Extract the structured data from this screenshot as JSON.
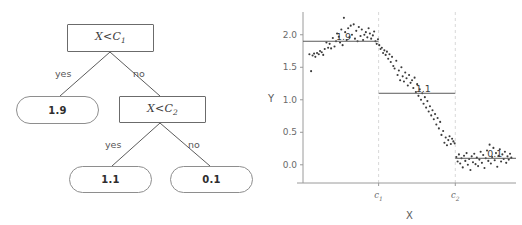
{
  "figure": {
    "left_panel_name": "decision-tree",
    "right_panel_name": "step-function-scatter-plot"
  },
  "tree": {
    "root": {
      "label_html": "X&lt;C",
      "var": "X",
      "op": "<",
      "threshold": "C",
      "sub": "1",
      "full_text": "X < C1"
    },
    "internal": {
      "label_html": "X&lt;C",
      "var": "X",
      "op": "<",
      "threshold": "C",
      "sub": "2",
      "full_text": "X < C2"
    },
    "leaves": [
      {
        "name": "leaf-1-9",
        "value": "1.9"
      },
      {
        "name": "leaf-1-1",
        "value": "1.1"
      },
      {
        "name": "leaf-0-1",
        "value": "0.1"
      }
    ],
    "edges": [
      {
        "name": "edge-root-yes",
        "label": "yes"
      },
      {
        "name": "edge-root-no",
        "label": "no"
      },
      {
        "name": "edge-inner-yes",
        "label": "yes"
      },
      {
        "name": "edge-inner-no",
        "label": "no"
      }
    ]
  },
  "chart_data": {
    "type": "scatter",
    "title": "",
    "xlabel": "X",
    "ylabel": "Y",
    "xlim": [
      0,
      10
    ],
    "ylim": [
      -0.28,
      2.35
    ],
    "grid": false,
    "legend": null,
    "yticks": [
      0.0,
      0.5,
      1.0,
      1.5,
      2.0
    ],
    "ytick_labels": [
      "0.0",
      "0.5",
      "1.0",
      "1.5",
      "2.0"
    ],
    "xticks": [
      3.55,
      7.15
    ],
    "xtick_labels": [
      "c1",
      "c2"
    ],
    "xtick_sub_labels": [
      {
        "base": "c",
        "sub": "1"
      },
      {
        "base": "c",
        "sub": "2"
      }
    ],
    "vlines": [
      {
        "name": "threshold-c1",
        "x": 3.55,
        "style": "dashed",
        "color": "#d8d8d8"
      },
      {
        "name": "threshold-c2",
        "x": 7.15,
        "style": "dashed",
        "color": "#d8d8d8"
      }
    ],
    "step_segments": [
      {
        "name": "segment-1-9",
        "x_start": 0.0,
        "x_end": 3.55,
        "y": 1.9,
        "annotation": "1.9",
        "annot_x": 1.9,
        "annot_y": 1.9
      },
      {
        "name": "segment-1-1",
        "x_start": 3.55,
        "x_end": 7.15,
        "y": 1.1,
        "annotation": "1.1",
        "annot_x": 5.65,
        "annot_y": 1.1
      },
      {
        "name": "segment-0-1",
        "x_start": 7.15,
        "x_end": 10.0,
        "y": 0.1,
        "annotation": "0.1",
        "annot_x": 9.0,
        "annot_y": 0.1
      }
    ],
    "series": [
      {
        "name": "observations",
        "marker": "dot",
        "color": "#3b3b3b",
        "points": [
          [
            0.3,
            1.7
          ],
          [
            0.38,
            1.44
          ],
          [
            0.45,
            1.68
          ],
          [
            0.52,
            1.71
          ],
          [
            0.58,
            1.66
          ],
          [
            0.66,
            1.72
          ],
          [
            0.74,
            1.7
          ],
          [
            0.8,
            1.75
          ],
          [
            0.88,
            1.73
          ],
          [
            0.95,
            1.69
          ],
          [
            1.02,
            1.78
          ],
          [
            1.1,
            1.88
          ],
          [
            1.18,
            1.8
          ],
          [
            1.25,
            1.86
          ],
          [
            1.32,
            1.79
          ],
          [
            1.4,
            1.95
          ],
          [
            1.48,
            1.82
          ],
          [
            1.55,
            1.9
          ],
          [
            1.6,
            2.02
          ],
          [
            1.68,
            1.97
          ],
          [
            1.74,
            1.88
          ],
          [
            1.8,
            2.08
          ],
          [
            1.86,
            1.84
          ],
          [
            1.92,
            2.26
          ],
          [
            1.98,
            2.04
          ],
          [
            2.05,
            1.92
          ],
          [
            2.12,
            2.1
          ],
          [
            2.18,
            1.96
          ],
          [
            2.24,
            2.14
          ],
          [
            2.3,
            2.0
          ],
          [
            2.38,
            2.16
          ],
          [
            2.44,
            1.94
          ],
          [
            2.5,
            2.06
          ],
          [
            2.56,
            1.9
          ],
          [
            2.62,
            2.12
          ],
          [
            2.7,
            1.98
          ],
          [
            2.76,
            2.08
          ],
          [
            2.82,
            1.92
          ],
          [
            2.88,
            2.0
          ],
          [
            2.95,
            2.04
          ],
          [
            3.02,
            1.96
          ],
          [
            3.08,
            2.1
          ],
          [
            3.14,
            2.02
          ],
          [
            3.2,
            1.94
          ],
          [
            3.28,
            1.99
          ],
          [
            3.34,
            2.05
          ],
          [
            3.4,
            1.9
          ],
          [
            3.46,
            1.86
          ],
          [
            3.52,
            1.93
          ],
          [
            3.58,
            1.84
          ],
          [
            3.64,
            1.78
          ],
          [
            3.7,
            1.8
          ],
          [
            3.76,
            1.72
          ],
          [
            3.82,
            1.76
          ],
          [
            3.88,
            1.69
          ],
          [
            3.94,
            1.74
          ],
          [
            4.0,
            1.63
          ],
          [
            4.06,
            1.7
          ],
          [
            4.12,
            1.58
          ],
          [
            4.18,
            1.66
          ],
          [
            4.24,
            1.52
          ],
          [
            4.3,
            1.48
          ],
          [
            4.38,
            1.6
          ],
          [
            4.44,
            1.38
          ],
          [
            4.5,
            1.45
          ],
          [
            4.56,
            1.3
          ],
          [
            4.62,
            1.5
          ],
          [
            4.68,
            1.36
          ],
          [
            4.74,
            1.28
          ],
          [
            4.8,
            1.42
          ],
          [
            4.86,
            1.33
          ],
          [
            4.92,
            1.22
          ],
          [
            4.98,
            1.38
          ],
          [
            5.05,
            1.26
          ],
          [
            5.12,
            1.3
          ],
          [
            5.18,
            1.18
          ],
          [
            5.24,
            1.34
          ],
          [
            5.3,
            1.12
          ],
          [
            5.36,
            1.24
          ],
          [
            5.42,
            1.06
          ],
          [
            5.48,
            1.16
          ],
          [
            5.54,
            1.0
          ],
          [
            5.6,
            1.1
          ],
          [
            5.66,
            0.94
          ],
          [
            5.72,
            1.04
          ],
          [
            5.78,
            0.88
          ],
          [
            5.84,
            0.98
          ],
          [
            5.9,
            0.82
          ],
          [
            5.96,
            0.9
          ],
          [
            6.02,
            0.76
          ],
          [
            6.08,
            0.84
          ],
          [
            6.14,
            0.7
          ],
          [
            6.2,
            0.78
          ],
          [
            6.26,
            0.62
          ],
          [
            6.32,
            0.72
          ],
          [
            6.38,
            0.56
          ],
          [
            6.44,
            0.66
          ],
          [
            6.5,
            0.46
          ],
          [
            6.58,
            0.52
          ],
          [
            6.64,
            0.34
          ],
          [
            6.7,
            0.42
          ],
          [
            6.76,
            0.3
          ],
          [
            6.82,
            0.38
          ],
          [
            6.88,
            0.44
          ],
          [
            6.94,
            0.32
          ],
          [
            7.0,
            0.4
          ],
          [
            7.06,
            0.36
          ],
          [
            7.12,
            0.33
          ],
          [
            7.2,
            0.12
          ],
          [
            7.26,
            0.05
          ],
          [
            7.32,
            0.16
          ],
          [
            7.38,
            0.02
          ],
          [
            7.44,
            0.1
          ],
          [
            7.5,
            -0.04
          ],
          [
            7.56,
            0.14
          ],
          [
            7.62,
            0.06
          ],
          [
            7.68,
            0.18
          ],
          [
            7.74,
            0.0
          ],
          [
            7.8,
            0.09
          ],
          [
            7.86,
            -0.08
          ],
          [
            7.92,
            0.13
          ],
          [
            7.98,
            0.04
          ],
          [
            8.04,
            0.17
          ],
          [
            8.1,
            0.01
          ],
          [
            8.16,
            0.11
          ],
          [
            8.22,
            -0.02
          ],
          [
            8.28,
            0.08
          ],
          [
            8.34,
            0.2
          ],
          [
            8.4,
            0.03
          ],
          [
            8.46,
            0.15
          ],
          [
            8.52,
            -0.05
          ],
          [
            8.58,
            0.1
          ],
          [
            8.64,
            0.22
          ],
          [
            8.7,
            0.06
          ],
          [
            8.76,
            0.31
          ],
          [
            8.82,
            0.02
          ],
          [
            8.88,
            0.12
          ],
          [
            8.94,
            0.26
          ],
          [
            9.0,
            0.07
          ],
          [
            9.06,
            0.18
          ],
          [
            9.12,
            -0.03
          ],
          [
            9.18,
            0.14
          ],
          [
            9.24,
            0.24
          ],
          [
            9.3,
            0.05
          ],
          [
            9.36,
            0.16
          ],
          [
            9.42,
            0.09
          ],
          [
            9.48,
            0.2
          ],
          [
            9.54,
            0.03
          ],
          [
            9.6,
            0.13
          ],
          [
            9.66,
            0.08
          ],
          [
            9.72,
            0.17
          ],
          [
            9.78,
            0.11
          ]
        ]
      }
    ]
  },
  "colors": {
    "decision_border": "#6b6b6b",
    "leaf_border": "#8e8e8e",
    "edge_line": "#5c5c5c",
    "axis": "#9a9a9a",
    "step_line": "#5a5a5a",
    "vline": "#dcdcdc",
    "point": "#3b3b3b",
    "text": "#4a4a4a"
  }
}
